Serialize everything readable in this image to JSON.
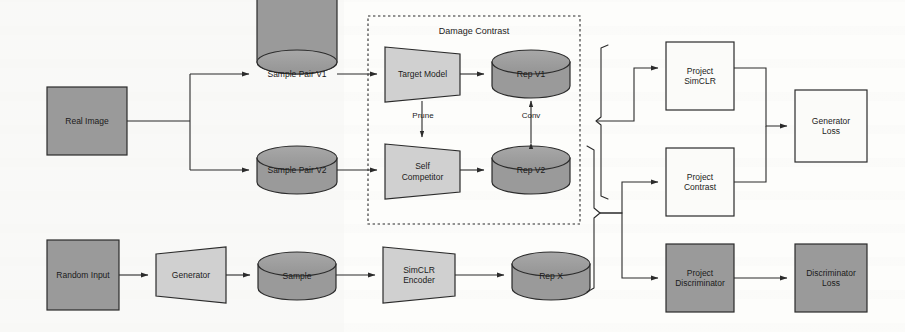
{
  "figure": {
    "type": "block-flow-diagram",
    "background_color": "#fdfdfb",
    "stroke_color": "#2b2b2b",
    "fill_dark": "#9a9a9a",
    "fill_light": "#d0d0d0",
    "fill_white": "#fbfbf9"
  },
  "groups": [
    {
      "id": "damage-contrast",
      "title": "Damage Contrast",
      "style": "dashed",
      "x": 368,
      "y": 16,
      "w": 212,
      "h": 208
    }
  ],
  "nodes": {
    "real_image": {
      "label": "Real Image",
      "shape": "rect",
      "fill": "dark",
      "x": 47,
      "y": 87,
      "w": 80,
      "h": 68
    },
    "sample_pair_v1": {
      "label": "Sample Pair V1",
      "shape": "cylinder",
      "fill": "dark",
      "x": 257,
      "y": 50,
      "w": 80,
      "h": 48
    },
    "sample_pair_v2": {
      "label": "Sample Pair V2",
      "shape": "cylinder",
      "fill": "dark",
      "x": 257,
      "y": 146,
      "w": 80,
      "h": 48
    },
    "target_model": {
      "label": "Target Model",
      "shape": "trap-right",
      "fill": "light",
      "x": 385,
      "y": 47,
      "w": 75,
      "h": 55
    },
    "self_competitor": {
      "label": "Self\nCompetitor",
      "shape": "trap-right",
      "fill": "light",
      "x": 385,
      "y": 144,
      "w": 75,
      "h": 55
    },
    "rep_v1": {
      "label": "Rep V1",
      "shape": "cylinder",
      "fill": "dark",
      "x": 492,
      "y": 50,
      "w": 78,
      "h": 48
    },
    "rep_v2": {
      "label": "Rep V2",
      "shape": "cylinder",
      "fill": "dark",
      "x": 492,
      "y": 146,
      "w": 78,
      "h": 48
    },
    "random_input": {
      "label": "Random Input",
      "shape": "rect",
      "fill": "dark",
      "x": 47,
      "y": 240,
      "w": 72,
      "h": 70
    },
    "generator": {
      "label": "Generator",
      "shape": "trap-left",
      "fill": "light",
      "x": 156,
      "y": 247,
      "w": 70,
      "h": 56
    },
    "sample": {
      "label": "Sample",
      "shape": "cylinder",
      "fill": "dark",
      "x": 258,
      "y": 252,
      "w": 78,
      "h": 48
    },
    "simclr_encoder": {
      "label": "SimCLR\nEncoder",
      "shape": "trap-right",
      "fill": "light",
      "x": 383,
      "y": 247,
      "w": 72,
      "h": 56
    },
    "rep_x": {
      "label": "Rep X",
      "shape": "cylinder",
      "fill": "dark",
      "x": 512,
      "y": 252,
      "w": 78,
      "h": 48
    },
    "project_simclr": {
      "label": "Project\nSimCLR",
      "shape": "rect",
      "fill": "white",
      "x": 666,
      "y": 42,
      "w": 68,
      "h": 68
    },
    "project_contrast": {
      "label": "Project\nContrast",
      "shape": "rect",
      "fill": "white",
      "x": 666,
      "y": 148,
      "w": 68,
      "h": 68
    },
    "project_discriminator": {
      "label": "Project\nDiscriminator",
      "shape": "rect",
      "fill": "dark",
      "x": 666,
      "y": 244,
      "w": 68,
      "h": 68
    },
    "generator_loss": {
      "label": "Generator\nLoss",
      "shape": "rect",
      "fill": "white",
      "x": 795,
      "y": 90,
      "w": 72,
      "h": 72
    },
    "discriminator_loss": {
      "label": "Discriminator\nLoss",
      "shape": "rect",
      "fill": "dark",
      "x": 795,
      "y": 244,
      "w": 72,
      "h": 68
    }
  },
  "edge_labels": [
    {
      "id": "prune",
      "text": "Prune",
      "x": 400,
      "y": 116
    },
    {
      "id": "conv",
      "text": "Conv",
      "x": 518,
      "y": 116
    }
  ],
  "flow": [
    {
      "from": "real_image",
      "to": "sample_pair_v1"
    },
    {
      "from": "real_image",
      "to": "sample_pair_v2"
    },
    {
      "from": "sample_pair_v1",
      "to": "target_model"
    },
    {
      "from": "sample_pair_v2",
      "to": "self_competitor"
    },
    {
      "from": "target_model",
      "to": "self_competitor",
      "label": "Prune"
    },
    {
      "from": "target_model",
      "to": "rep_v1"
    },
    {
      "from": "self_competitor",
      "to": "rep_v2"
    },
    {
      "from": "rep_v2",
      "to": "rep_v1",
      "label": "Conv",
      "bidirectional": true
    },
    {
      "from": "random_input",
      "to": "generator"
    },
    {
      "from": "generator",
      "to": "sample"
    },
    {
      "from": "sample",
      "to": "simclr_encoder"
    },
    {
      "from": "simclr_encoder",
      "to": "rep_x"
    },
    {
      "from": "rep_v1",
      "to": "project_simclr",
      "via": "brace-top"
    },
    {
      "from": "rep_x",
      "to": "project_simclr",
      "via": "brace-top"
    },
    {
      "from": "rep_v2",
      "to": "project_contrast",
      "via": "brace-bottom"
    },
    {
      "from": "rep_x",
      "to": "project_contrast",
      "via": "brace-bottom"
    },
    {
      "from": "rep_v2",
      "to": "project_discriminator",
      "via": "brace-bottom"
    },
    {
      "from": "rep_x",
      "to": "project_discriminator",
      "via": "brace-bottom"
    },
    {
      "from": "project_simclr",
      "to": "generator_loss"
    },
    {
      "from": "project_contrast",
      "to": "generator_loss"
    },
    {
      "from": "project_discriminator",
      "to": "discriminator_loss"
    }
  ]
}
